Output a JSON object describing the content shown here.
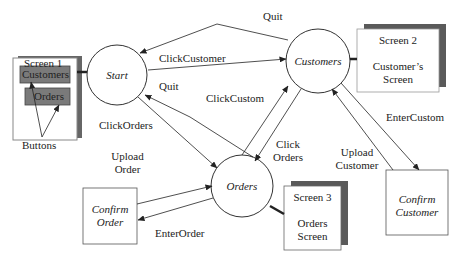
{
  "diagram": {
    "type": "state-transition",
    "states": [
      {
        "id": "start",
        "label": "Start"
      },
      {
        "id": "customers",
        "label": "Customers"
      },
      {
        "id": "orders",
        "label": "Orders"
      }
    ],
    "boxes": [
      {
        "id": "confirm_order",
        "label_line1": "Confirm",
        "label_line2": "Order"
      },
      {
        "id": "confirm_customer",
        "label_line1": "Confirm",
        "label_line2": "Customer"
      }
    ],
    "screens": {
      "screen1": {
        "title": "Screen 1",
        "buttons": [
          "Customers",
          "Orders"
        ],
        "callout": "Buttons"
      },
      "screen2": {
        "title": "Screen 2",
        "line1": "Customer’s",
        "line2": "Screen"
      },
      "screen3": {
        "title": "Screen 3",
        "line1": "Orders",
        "line2": "Screen"
      }
    },
    "transitions": {
      "quit_top": "Quit",
      "click_customer": "ClickCustomer",
      "quit_mid": "Quit",
      "click_custom": "ClickCustom",
      "click_orders_left": "ClickOrders",
      "click_orders_right_1": "Click",
      "click_orders_right_2": "Orders",
      "upload_order_1": "Upload",
      "upload_order_2": "Order",
      "enter_order": "EnterOrder",
      "upload_customer_1": "Upload",
      "upload_customer_2": "Customer",
      "enter_custom": "EnterCustom"
    },
    "colors": {
      "line": "#333333",
      "button_fill": "#7a7a7a",
      "shadow": "#5a5a5a",
      "box_border": "#888888"
    }
  }
}
